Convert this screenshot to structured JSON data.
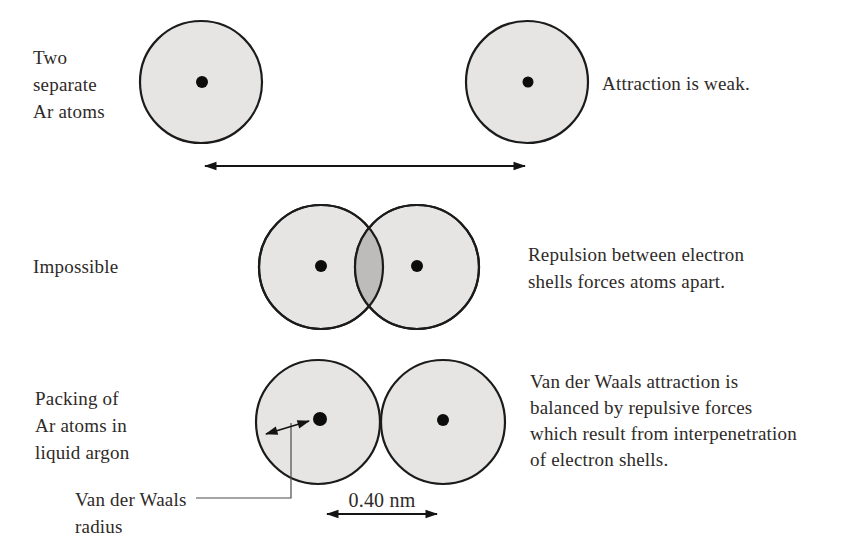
{
  "figure": {
    "row1": {
      "label_lines": [
        "Two",
        "separate",
        "Ar atoms"
      ],
      "caption": "Attraction is weak."
    },
    "row2": {
      "label": "Impossible",
      "caption_lines": [
        "Repulsion between electron",
        "shells forces atoms apart."
      ]
    },
    "row3": {
      "label_lines": [
        "Packing of",
        "Ar atoms in",
        "liquid argon"
      ],
      "caption_lines": [
        "Van der Waals attraction is",
        "balanced by repulsive forces",
        "which result from interpenetration",
        "of electron shells."
      ],
      "radius_label_lines": [
        "Van der Waals",
        "radius"
      ],
      "distance_label": "0.40 nm"
    }
  },
  "colors": {
    "background": "#ffffff",
    "text": "#2e2a28",
    "atom_fill": "#e6e5e3",
    "overlap_fill": "#bdbcba",
    "outline": "#1b1b1b",
    "arrow": "#141414",
    "leader": "#4a4a4a"
  }
}
